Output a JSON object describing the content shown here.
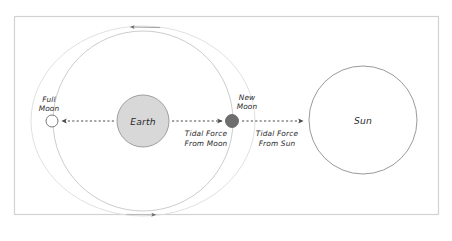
{
  "diagram": {
    "frame": {
      "stroke": "#d0d0d0"
    },
    "background": "#ffffff",
    "bodies": {
      "earth": {
        "label": "Earth",
        "fill": "#d6d6d6",
        "stroke": "#9a9a9a",
        "cx": 143,
        "cy": 121,
        "r": 26
      },
      "sun": {
        "label": "Sun",
        "fill": "#ffffff",
        "stroke": "#9a9a9a",
        "cx": 363,
        "cy": 120,
        "r": 54
      },
      "full_moon": {
        "label_line1": "Full",
        "label_line2": "Moon",
        "fill": "#ffffff",
        "stroke": "#7a7a7a",
        "cx": 52,
        "cy": 121,
        "r": 6
      },
      "new_moon": {
        "label_line1": "New",
        "label_line2": "Moon",
        "fill": "#6e6e6e",
        "stroke": "#5a5a5a",
        "cx": 232,
        "cy": 121,
        "r": 6.5
      }
    },
    "orbits": {
      "inner": {
        "cx": 143,
        "cy": 121,
        "rx": 90,
        "ry": 90,
        "stroke": "#c2c2c2"
      },
      "outer": {
        "cx": 143,
        "cy": 121,
        "rx": 110,
        "ry": 95,
        "stroke": "#d8d8d8"
      },
      "direction_top_arrow": "left",
      "direction_bottom_arrow": "right"
    },
    "forces": [
      {
        "name": "tidal-force-from-moon",
        "label_line1": "Tidal Force",
        "label_line2": "From Moon",
        "arrow_direction": "right",
        "stroke": "#4a4a4a"
      },
      {
        "name": "tidal-force-from-sun",
        "label_line1": "Tidal Force",
        "label_line2": "From Sun",
        "arrow_direction": "right",
        "stroke": "#4a4a4a"
      },
      {
        "name": "tidal-force-toward-full-moon",
        "arrow_direction": "left",
        "stroke": "#4a4a4a"
      }
    ]
  }
}
